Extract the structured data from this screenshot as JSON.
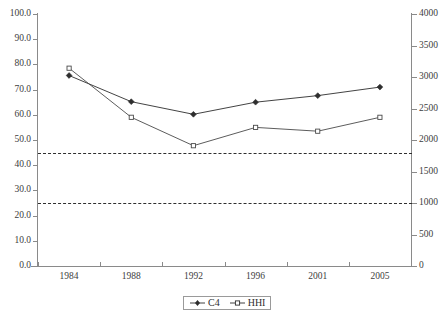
{
  "chart_data": {
    "type": "line",
    "title": "",
    "subtitle": "",
    "xlabel": "",
    "ylabel": "",
    "grid": false,
    "legend_position": "bottom-center",
    "categories": [
      "1984",
      "1988",
      "1992",
      "1996",
      "2001",
      "2005"
    ],
    "axes": {
      "left": {
        "label": "",
        "ylim": [
          0.0,
          100.0
        ],
        "tick_step": 10.0,
        "ticks": [
          "0.0",
          "10.0",
          "20.0",
          "30.0",
          "40.0",
          "50.0",
          "60.0",
          "70.0",
          "80.0",
          "90.0",
          "100.0"
        ],
        "series": "C4"
      },
      "right": {
        "label": "",
        "ylim": [
          0,
          4000
        ],
        "tick_step": 500,
        "ticks": [
          "0",
          "500",
          "1000",
          "1500",
          "2000",
          "2500",
          "3000",
          "3500",
          "4000"
        ],
        "series": "HHI"
      }
    },
    "series": [
      {
        "name": "C4",
        "axis": "left",
        "marker": "filled-diamond",
        "color": "#2e2e2e",
        "values": [
          75.6,
          65.2,
          60.2,
          65.0,
          67.6,
          71.0
        ]
      },
      {
        "name": "HHI",
        "axis": "right",
        "marker": "open-square",
        "color": "#4a4a4a",
        "values": [
          3140,
          2360,
          1910,
          2200,
          2140,
          2360
        ]
      }
    ],
    "reference_lines": [
      {
        "name": "hhi-threshold-1800",
        "axis": "right",
        "value": 1800,
        "left_axis_equivalent": 45.0,
        "style": "dashed",
        "color": "#2e2e2e"
      },
      {
        "name": "hhi-threshold-1000",
        "axis": "right",
        "value": 1000,
        "left_axis_equivalent": 25.0,
        "style": "dashed",
        "color": "#2e2e2e"
      }
    ]
  },
  "legend": {
    "entries": [
      {
        "label": "C4",
        "marker": "filled-diamond"
      },
      {
        "label": "HHI",
        "marker": "open-square"
      }
    ]
  }
}
